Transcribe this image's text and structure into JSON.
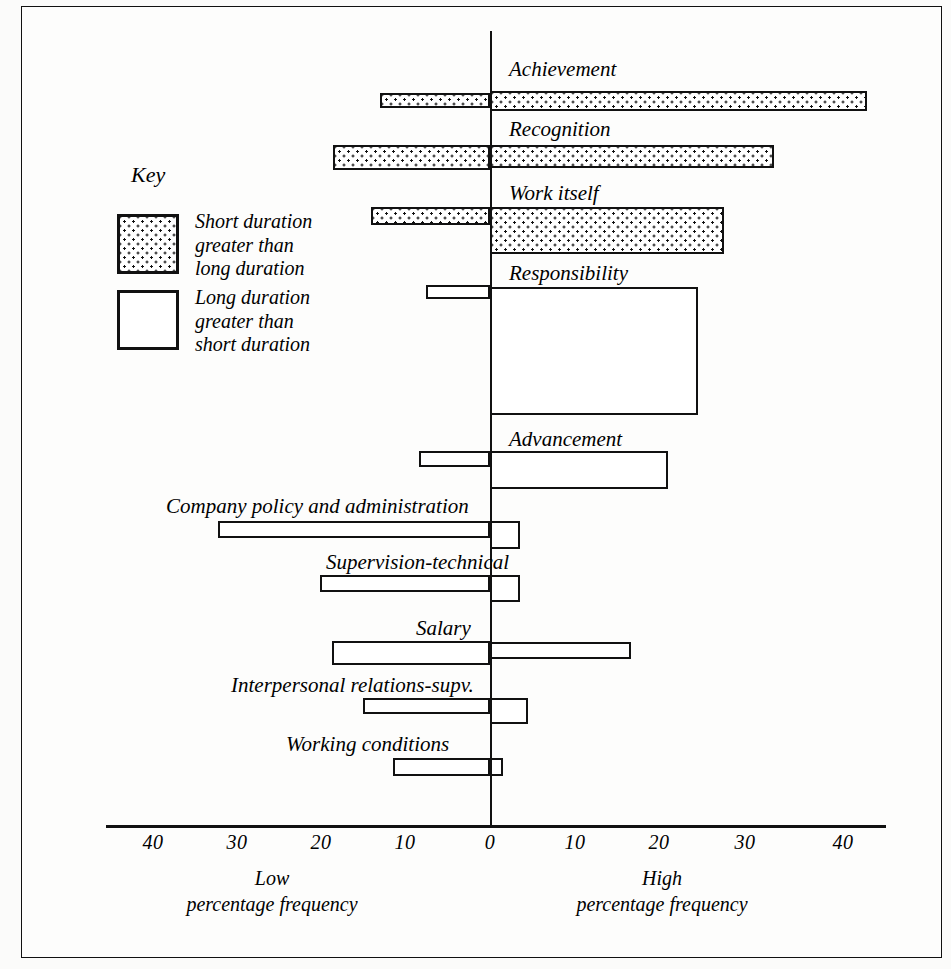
{
  "chart_data": {
    "type": "bar",
    "title": "",
    "subtitle": "",
    "orientation": "horizontal-diverging",
    "xlabel_left": "Low percentage frequency",
    "xlabel_right": "High percentage frequency",
    "ylabel": "",
    "grid": false,
    "xlim": [
      -45,
      45
    ],
    "tick_values": [
      -40,
      -30,
      -20,
      -10,
      0,
      10,
      20,
      30,
      40
    ],
    "tick_labels": [
      "40",
      "30",
      "20",
      "10",
      "0",
      "10",
      "20",
      "30",
      "40"
    ],
    "legend_position": "upper-left",
    "series": [
      {
        "name": "Short duration greater than long duration",
        "fill": "dotted"
      },
      {
        "name": "Long duration greater than short duration",
        "fill": "white"
      }
    ],
    "categories": [
      "Achievement",
      "Recognition",
      "Work itself",
      "Responsibility",
      "Advancement",
      "Company policy and administration",
      "Supervision-technical",
      "Salary",
      "Interpersonal relations-supv.",
      "Working conditions"
    ],
    "low_values": [
      13,
      18.5,
      14,
      7.5,
      8.5,
      32,
      20,
      19,
      15,
      11
    ],
    "high_values": [
      44,
      33,
      27.5,
      24.5,
      21,
      3.5,
      3.5,
      16.5,
      4.5,
      1.5
    ]
  },
  "figure": {
    "key_title": "Key",
    "key_items": [
      {
        "fill": "dotted",
        "lines": [
          "Short duration",
          "greater than",
          "long duration"
        ]
      },
      {
        "fill": "white",
        "lines": [
          "Long duration",
          "greater than",
          "short duration"
        ]
      }
    ],
    "axis_captions": {
      "low": {
        "line1": "Low",
        "line2": "percentage frequency"
      },
      "high": {
        "line1": "High",
        "line2": "percentage frequency"
      }
    },
    "bars": [
      {
        "label": "Achievement",
        "label_x": 508,
        "label_y": 58,
        "low": {
          "value": 13,
          "fill": "dotted",
          "x": 379,
          "y": 92,
          "w": 110,
          "h": 15
        },
        "high": {
          "value": 44,
          "fill": "dotted",
          "x": 489,
          "y": 90,
          "w": 377,
          "h": 20
        }
      },
      {
        "label": "Recognition",
        "label_x": 508,
        "label_y": 118,
        "low": {
          "value": 18.5,
          "fill": "dotted",
          "x": 332,
          "y": 144,
          "w": 157,
          "h": 25
        },
        "high": {
          "value": 33,
          "fill": "dotted",
          "x": 489,
          "y": 144,
          "w": 284,
          "h": 23
        }
      },
      {
        "label": "Work itself",
        "label_x": 508,
        "label_y": 182,
        "low": {
          "value": 14,
          "fill": "dotted",
          "x": 370,
          "y": 206,
          "w": 119,
          "h": 18
        },
        "high": {
          "value": 27.5,
          "fill": "dotted",
          "x": 489,
          "y": 206,
          "w": 234,
          "h": 47
        }
      },
      {
        "label": "Responsibility",
        "label_x": 508,
        "label_y": 262,
        "low": {
          "value": 7.5,
          "fill": "white",
          "x": 425,
          "y": 284,
          "w": 64,
          "h": 14
        },
        "high": {
          "value": 24.5,
          "fill": "white",
          "x": 489,
          "y": 286,
          "w": 208,
          "h": 128
        }
      },
      {
        "label": "Advancement",
        "label_x": 508,
        "label_y": 428,
        "low": {
          "value": 8.5,
          "fill": "white",
          "x": 418,
          "y": 450,
          "w": 71,
          "h": 16
        },
        "high": {
          "value": 21,
          "fill": "white",
          "x": 489,
          "y": 450,
          "w": 178,
          "h": 38
        }
      },
      {
        "label": "Company policy and administration",
        "label_x": 165,
        "label_y": 495,
        "low": {
          "value": 32,
          "fill": "white",
          "x": 217,
          "y": 520,
          "w": 272,
          "h": 17
        },
        "high": {
          "value": 3.5,
          "fill": "white",
          "x": 489,
          "y": 520,
          "w": 30,
          "h": 28
        }
      },
      {
        "label": "Supervision-technical",
        "label_x": 325,
        "label_y": 551,
        "low": {
          "value": 20,
          "fill": "white",
          "x": 319,
          "y": 574,
          "w": 170,
          "h": 17
        },
        "high": {
          "value": 3.5,
          "fill": "white",
          "x": 489,
          "y": 574,
          "w": 30,
          "h": 27
        }
      },
      {
        "label": "Salary",
        "label_x": 415,
        "label_y": 617,
        "low": {
          "value": 19,
          "fill": "white",
          "x": 331,
          "y": 640,
          "w": 158,
          "h": 24
        },
        "high": {
          "value": 16.5,
          "fill": "white",
          "x": 489,
          "y": 641,
          "w": 141,
          "h": 17
        }
      },
      {
        "label": "Interpersonal relations-supv.",
        "label_x": 230,
        "label_y": 674,
        "low": {
          "value": 15,
          "fill": "white",
          "x": 362,
          "y": 697,
          "w": 127,
          "h": 16
        },
        "high": {
          "value": 4.5,
          "fill": "white",
          "x": 489,
          "y": 697,
          "w": 38,
          "h": 26
        }
      },
      {
        "label": "Working conditions",
        "label_x": 285,
        "label_y": 733,
        "low": {
          "value": 11,
          "fill": "white",
          "x": 392,
          "y": 757,
          "w": 97,
          "h": 18
        },
        "high": {
          "value": 1.5,
          "fill": "white",
          "x": 489,
          "y": 757,
          "w": 13,
          "h": 18
        }
      }
    ],
    "ticks": [
      {
        "label": "40",
        "x": 152
      },
      {
        "label": "30",
        "x": 236
      },
      {
        "label": "20",
        "x": 320
      },
      {
        "label": "10",
        "x": 404
      },
      {
        "label": "0",
        "x": 489
      },
      {
        "label": "10",
        "x": 574
      },
      {
        "label": "20",
        "x": 658
      },
      {
        "label": "30",
        "x": 744
      },
      {
        "label": "40",
        "x": 842
      }
    ]
  },
  "colors": {
    "ink": "#111111",
    "paper": "#fdfdfc",
    "page": "#fbfbfa"
  }
}
